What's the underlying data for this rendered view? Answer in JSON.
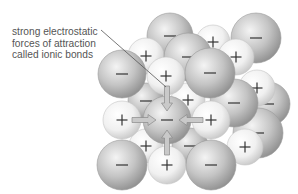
{
  "annotation": {
    "lines": [
      "strong electrostatic",
      "forces of attraction",
      "called ionic bonds"
    ]
  },
  "ions": {
    "negative_symbol": "−",
    "positive_symbol": "+"
  },
  "colors": {
    "negative_ion_light": "#f2f2f2",
    "negative_ion_dark": "#9a9a9a",
    "positive_ion_light": "#ffffff",
    "positive_ion_dark": "#d4d4d4",
    "arrow_fill": "#c8c8c8",
    "arrow_stroke": "#8a8a8a",
    "leader_line": "#555555",
    "text": "#555555"
  },
  "spheres": [
    {
      "id": "back-top-neg-1",
      "charge": "-",
      "cx": 170,
      "cy": 36,
      "r": 23
    },
    {
      "id": "back-top-pos-1",
      "charge": "+",
      "cx": 213,
      "cy": 42,
      "r": 17
    },
    {
      "id": "back-top-neg-2",
      "charge": "-",
      "cx": 256,
      "cy": 38,
      "r": 25
    },
    {
      "id": "back-right-neg-1",
      "charge": "-",
      "cx": 268,
      "cy": 104,
      "r": 22
    },
    {
      "id": "back-right-neg-2",
      "charge": "-",
      "cx": 258,
      "cy": 133,
      "r": 25
    },
    {
      "id": "back-right-pos-1",
      "charge": "+",
      "cx": 257,
      "cy": 88,
      "r": 18
    },
    {
      "id": "back-right-pos-2",
      "charge": "+",
      "cx": 245,
      "cy": 147,
      "r": 18
    },
    {
      "id": "mid-pos-1",
      "charge": "+",
      "cx": 146,
      "cy": 56,
      "r": 18
    },
    {
      "id": "mid-neg-1",
      "charge": "-",
      "cx": 188,
      "cy": 57,
      "r": 24
    },
    {
      "id": "mid-pos-2",
      "charge": "+",
      "cx": 236,
      "cy": 57,
      "r": 18
    },
    {
      "id": "mid-neg-2",
      "charge": "-",
      "cx": 234,
      "cy": 103,
      "r": 24
    },
    {
      "id": "mid-neg-3",
      "charge": "-",
      "cx": 146,
      "cy": 101,
      "r": 18
    },
    {
      "id": "mid-pos-3",
      "charge": "+",
      "cx": 188,
      "cy": 100,
      "r": 17
    },
    {
      "id": "mid-pos-4",
      "charge": "+",
      "cx": 146,
      "cy": 146,
      "r": 17
    },
    {
      "id": "mid-neg-4",
      "charge": "-",
      "cx": 190,
      "cy": 146,
      "r": 18
    },
    {
      "id": "front-neg-1",
      "charge": "-",
      "cx": 122,
      "cy": 74,
      "r": 24
    },
    {
      "id": "front-pos-1",
      "charge": "+",
      "cx": 166,
      "cy": 76,
      "r": 19
    },
    {
      "id": "front-neg-2",
      "charge": "-",
      "cx": 210,
      "cy": 73,
      "r": 25
    },
    {
      "id": "front-pos-2",
      "charge": "+",
      "cx": 122,
      "cy": 120,
      "r": 19
    },
    {
      "id": "front-neg-center",
      "charge": "-",
      "cx": 167,
      "cy": 120,
      "r": 24
    },
    {
      "id": "front-pos-3",
      "charge": "+",
      "cx": 211,
      "cy": 120,
      "r": 19
    },
    {
      "id": "front-neg-3",
      "charge": "-",
      "cx": 122,
      "cy": 165,
      "r": 25
    },
    {
      "id": "front-pos-4",
      "charge": "+",
      "cx": 167,
      "cy": 165,
      "r": 19
    },
    {
      "id": "front-neg-4",
      "charge": "-",
      "cx": 211,
      "cy": 165,
      "r": 25
    }
  ],
  "arrows": [
    {
      "id": "arrow-from-top",
      "direction": "down"
    },
    {
      "id": "arrow-from-left",
      "direction": "right"
    },
    {
      "id": "arrow-from-right",
      "direction": "left"
    },
    {
      "id": "arrow-from-bottom",
      "direction": "up"
    }
  ]
}
